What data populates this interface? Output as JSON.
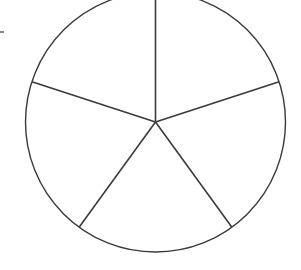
{
  "diagram": {
    "type": "circle-divided-into-equal-sectors",
    "sector_count": 5,
    "circle": {
      "cx": 155.5,
      "cy": 122,
      "r": 130
    },
    "stroke_color": "#3a3a3a",
    "background": "#ffffff",
    "start_angle_deg": -90,
    "margin_mark": {
      "x1": 0,
      "y1": 32,
      "x2": 4,
      "y2": 32
    }
  }
}
